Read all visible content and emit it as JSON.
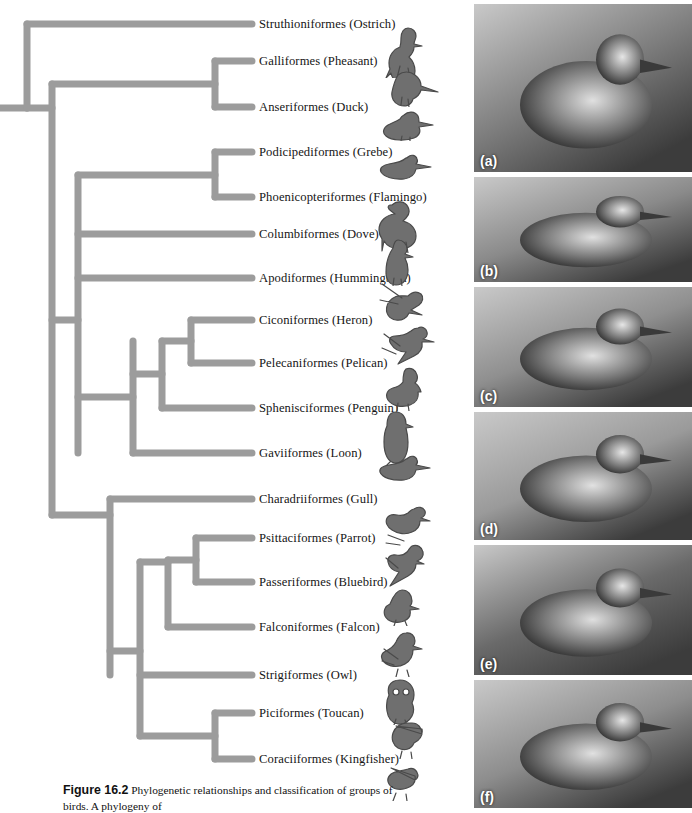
{
  "figure": {
    "number": "Figure 16.2",
    "caption_text": "Phylogenetic relationships and classification of groups of birds. A phylogeny of"
  },
  "diagram": {
    "type": "cladogram",
    "branch_color": "#9c9c9c",
    "root_label": "common ancestor of birds",
    "taxa": [
      {
        "id": "struthioniformes",
        "order": "Struthioniformes",
        "common": "Ostrich",
        "label": "Struthioniformes (Ostrich)",
        "y": 24,
        "tip_x": 252,
        "icon": "ostrich-icon"
      },
      {
        "id": "galliformes",
        "order": "Galliformes",
        "common": "Pheasant",
        "label": "Galliformes (Pheasant)",
        "y": 61,
        "tip_x": 252,
        "icon": "pheasant-icon"
      },
      {
        "id": "anseriformes",
        "order": "Anseriformes",
        "common": "Duck",
        "label": "Anseriformes (Duck)",
        "y": 107,
        "tip_x": 252,
        "icon": "duck-icon"
      },
      {
        "id": "podicipediformes",
        "order": "Podicipediformes",
        "common": "Grebe",
        "label": "Podicipediformes (Grebe)",
        "y": 152,
        "tip_x": 252,
        "icon": "grebe-icon"
      },
      {
        "id": "phoenicopteriformes",
        "order": "Phoenicopteriformes",
        "common": "Flamingo",
        "label": "Phoenicopteriformes (Flamingo)",
        "y": 197,
        "tip_x": 252,
        "icon": "flamingo-icon"
      },
      {
        "id": "columbiformes",
        "order": "Columbiformes",
        "common": "Dove",
        "label": "Columbiformes (Dove)",
        "y": 234,
        "tip_x": 252,
        "icon": "dove-icon"
      },
      {
        "id": "apodiformes",
        "order": "Apodiformes",
        "common": "Hummingbird",
        "label": "Apodiformes (Hummingbird)",
        "y": 278,
        "tip_x": 252,
        "icon": "hummingbird-icon"
      },
      {
        "id": "ciconiiformes",
        "order": "Ciconiformes",
        "common": "Heron",
        "label": "Ciconiformes (Heron)",
        "y": 320,
        "tip_x": 252,
        "icon": "heron-icon"
      },
      {
        "id": "pelecaniformes",
        "order": "Pelecaniformes",
        "common": "Pelican",
        "label": "Pelecaniformes (Pelican)",
        "y": 363,
        "tip_x": 252,
        "icon": "pelican-icon"
      },
      {
        "id": "sphenisciformes",
        "order": "Sphenisciformes",
        "common": "Penguin",
        "label": "Sphenisciformes (Penguin)",
        "y": 408,
        "tip_x": 252,
        "icon": "penguin-icon"
      },
      {
        "id": "gaviiformes",
        "order": "Gaviiformes",
        "common": "Loon",
        "label": "Gaviiformes (Loon)",
        "y": 453,
        "tip_x": 252,
        "icon": "loon-icon"
      },
      {
        "id": "charadriiformes",
        "order": "Charadriiformes",
        "common": "Gull",
        "label": "Charadriiformes (Gull)",
        "y": 499,
        "tip_x": 252,
        "icon": "gull-icon"
      },
      {
        "id": "psittaciformes",
        "order": "Psittaciformes",
        "common": "Parrot",
        "label": "Psittaciformes (Parrot)",
        "y": 538,
        "tip_x": 252,
        "icon": "parrot-icon"
      },
      {
        "id": "passeriformes",
        "order": "Passeriformes",
        "common": "Bluebird",
        "label": "Passeriformes (Bluebird)",
        "y": 582,
        "tip_x": 252,
        "icon": "bluebird-icon"
      },
      {
        "id": "falconiformes",
        "order": "Falconiformes",
        "common": "Falcon",
        "label": "Falconiformes (Falcon)",
        "y": 627,
        "tip_x": 252,
        "icon": "falcon-icon"
      },
      {
        "id": "strigiformes",
        "order": "Strigiformes",
        "common": "Owl",
        "label": "Strigiformes (Owl)",
        "y": 675,
        "tip_x": 252,
        "icon": "owl-icon"
      },
      {
        "id": "piciformes",
        "order": "Piciformes",
        "common": "Toucan",
        "label": "Piciformes (Toucan)",
        "y": 713,
        "tip_x": 252,
        "icon": "toucan-icon"
      },
      {
        "id": "coraciiformes",
        "order": "Coraciiformes",
        "common": "Kingfisher",
        "label": "Coraciiformes (Kingfisher)",
        "y": 759,
        "tip_x": 252,
        "icon": "kingfisher-icon"
      }
    ],
    "nodes": [
      {
        "id": "root",
        "x": 27,
        "y_top": 24,
        "y_bot": 108,
        "stem_from_x": 0,
        "stem_y": 108
      },
      {
        "id": "neognathae",
        "x": 52,
        "y_top": 84,
        "y_bot": 515,
        "stem_from_x": 27,
        "stem_y": 108
      },
      {
        "id": "galloanserae",
        "x": 215,
        "y_top": 61,
        "y_bot": 107,
        "stem_from_x": 52,
        "stem_y": 84
      },
      {
        "id": "neoaves",
        "x": 78,
        "y_top": 175,
        "y_bot": 453,
        "stem_from_x": 52,
        "stem_y": 320
      },
      {
        "id": "waterbirds",
        "x": 215,
        "y_top": 152,
        "y_bot": 197,
        "stem_from_x": 78,
        "stem_y": 175
      },
      {
        "id": "aequorn",
        "x": 133,
        "y_top": 341,
        "y_bot": 453,
        "stem_from_x": 78,
        "stem_y": 397
      },
      {
        "id": "pelecani",
        "x": 162,
        "y_top": 341,
        "y_bot": 408,
        "stem_from_x": 133,
        "stem_y": 374
      },
      {
        "id": "ciconii",
        "x": 191,
        "y_top": 320,
        "y_bot": 363,
        "stem_from_x": 162,
        "stem_y": 341
      },
      {
        "id": "lowerclade",
        "x": 110,
        "y_top": 499,
        "y_bot": 675,
        "stem_from_x": 52,
        "stem_y": 515
      },
      {
        "id": "telluraves",
        "x": 140,
        "y_top": 562,
        "y_bot": 736,
        "stem_from_x": 110,
        "stem_y": 651
      },
      {
        "id": "afroaves",
        "x": 168,
        "y_top": 560,
        "y_bot": 627,
        "stem_from_x": 140,
        "stem_y": 562
      },
      {
        "id": "psittapasser",
        "x": 196,
        "y_top": 538,
        "y_bot": 582,
        "stem_from_x": 168,
        "stem_y": 560
      },
      {
        "id": "coracii",
        "x": 215,
        "y_top": 713,
        "y_bot": 759,
        "stem_from_x": 140,
        "stem_y": 736
      }
    ]
  },
  "photos": {
    "panels": [
      {
        "letter": "(a)",
        "subject": "ostrich-head-photo",
        "height": 168,
        "tone": "#7d7d7d",
        "alt": "Ostrich head in profile"
      },
      {
        "letter": "(b)",
        "subject": "pheasant-quail-photo",
        "height": 105,
        "tone": "#8a8a8a",
        "alt": "Quail perched"
      },
      {
        "letter": "(c)",
        "subject": "duck-photo",
        "height": 120,
        "tone": "#8f8f8f",
        "alt": "Duck swimming on water"
      },
      {
        "letter": "(d)",
        "subject": "grebe-photo",
        "height": 128,
        "tone": "#9a9a9a",
        "alt": "Grebe swimming on water"
      },
      {
        "letter": "(e)",
        "subject": "flamingo-photo",
        "height": 130,
        "tone": "#6a6a6a",
        "alt": "Flamingo head and neck"
      },
      {
        "letter": "(f)",
        "subject": "dove-photo",
        "height": 128,
        "tone": "#8d8d8d",
        "alt": "Mourning dove perched on rock"
      }
    ]
  }
}
